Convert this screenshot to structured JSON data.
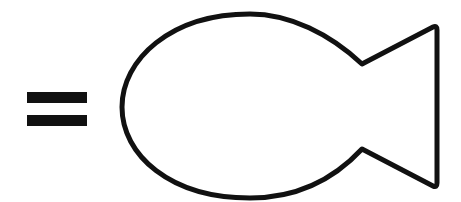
{
  "diagram": {
    "symbols": [
      {
        "type": "equals-sign",
        "color": "#111111"
      },
      {
        "type": "fish-outline",
        "stroke": "#111111",
        "fill": "#ffffff"
      }
    ]
  }
}
